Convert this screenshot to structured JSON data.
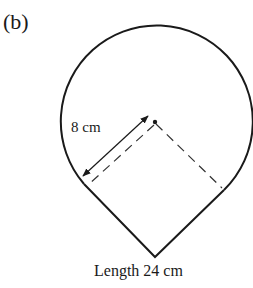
{
  "figure": {
    "part_label": "(b)",
    "radius_label": "8 cm",
    "length_label": "Length 24 cm"
  },
  "colors": {
    "stroke": "#1a1a1a",
    "dashed": "#333333",
    "background": "#ffffff"
  }
}
